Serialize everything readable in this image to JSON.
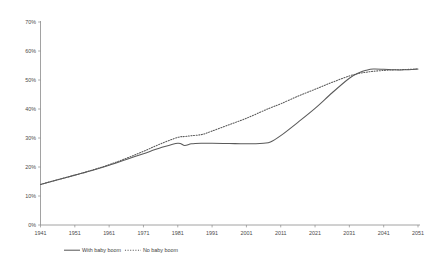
{
  "chart_data": {
    "type": "line",
    "title": "",
    "subtitle": "",
    "xlabel": "",
    "ylabel": "",
    "grid": false,
    "legend_position": "bottom-center",
    "xlim": [
      1941,
      2051
    ],
    "ylim": [
      0,
      70
    ],
    "x_tick_labels": [
      "1941",
      "1951",
      "1961",
      "1971",
      "1981",
      "1991",
      "2001",
      "2011",
      "2021",
      "2031",
      "2041",
      "2051"
    ],
    "x_ticks": [
      1941,
      1951,
      1961,
      1971,
      1981,
      1991,
      2001,
      2011,
      2021,
      2031,
      2041,
      2051
    ],
    "y_tick_labels": [
      "0%",
      "10%",
      "20%",
      "30%",
      "40%",
      "50%",
      "60%",
      "70%"
    ],
    "y_ticks": [
      0,
      10,
      20,
      30,
      40,
      50,
      60,
      70
    ],
    "x": [
      1941,
      1946,
      1951,
      1956,
      1961,
      1966,
      1971,
      1976,
      1981,
      1983,
      1985,
      1988,
      1991,
      1996,
      2001,
      2006,
      2008,
      2011,
      2016,
      2021,
      2026,
      2031,
      2034,
      2036,
      2038,
      2041,
      2044,
      2047,
      2051
    ],
    "series": [
      {
        "name": "With baby boom",
        "style": "solid",
        "color": "#5a5a5a",
        "values": [
          14.0,
          15.6,
          17.2,
          18.8,
          20.6,
          22.6,
          24.6,
          26.6,
          28.2,
          27.4,
          28.0,
          28.2,
          28.2,
          28.1,
          28.0,
          28.2,
          28.6,
          30.8,
          35.4,
          40.2,
          45.6,
          50.6,
          52.6,
          53.4,
          53.8,
          53.7,
          53.5,
          53.5,
          53.8
        ]
      },
      {
        "name": "No baby boom",
        "style": "dotted",
        "color": "#5a5a5a",
        "values": [
          14.0,
          15.6,
          17.2,
          18.9,
          20.8,
          23.0,
          25.4,
          28.0,
          30.2,
          30.5,
          30.8,
          31.2,
          32.4,
          34.6,
          36.8,
          39.4,
          40.4,
          41.8,
          44.4,
          46.8,
          49.2,
          51.4,
          52.3,
          52.7,
          53.0,
          53.3,
          53.5,
          53.6,
          53.8
        ]
      }
    ]
  },
  "legend": {
    "items": [
      {
        "label": "With baby boom",
        "style": "solid"
      },
      {
        "label": "No baby boom",
        "style": "dotted"
      }
    ]
  }
}
